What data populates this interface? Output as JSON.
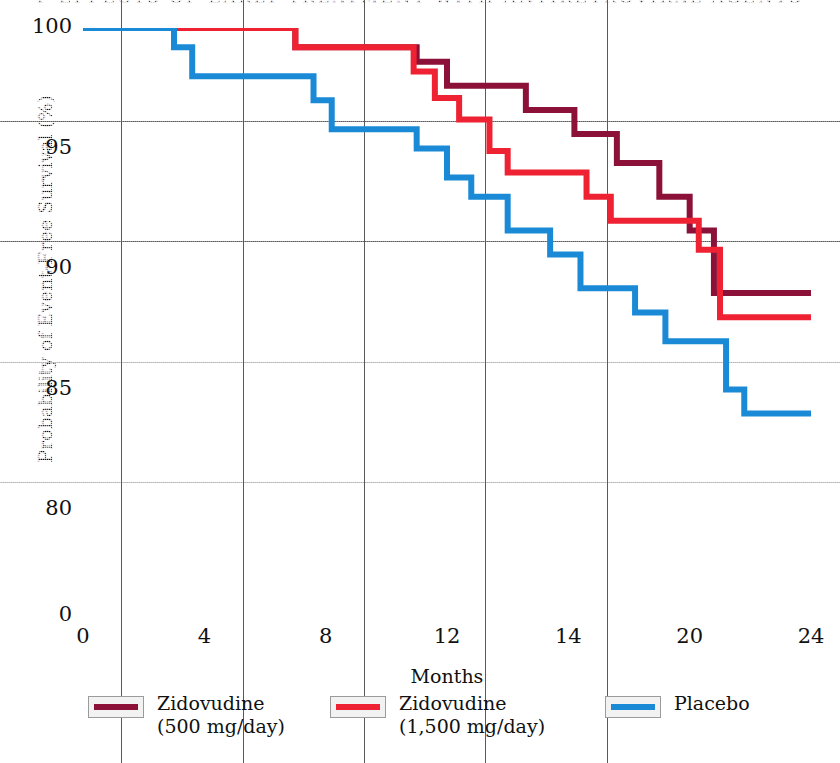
{
  "figure": {
    "title": "P EFFECTS OF EARLY TREATMENT WITH ANTIRETROVIRAL AGENTS",
    "background_color": "#e9e9e9",
    "frame_color": "#4a4a4a"
  },
  "axes": {
    "ylabel": "Probability of Event-Free Survival (%)",
    "xlabel": "Months",
    "yticks": [
      "100",
      "95",
      "90",
      "85",
      "80"
    ],
    "ybreak_tick": "0",
    "xticks": [
      "0",
      "4",
      "8",
      "12",
      "14",
      "20",
      "24"
    ],
    "ylim": [
      78,
      100
    ],
    "xlim": [
      0,
      24
    ],
    "grid": "on"
  },
  "legend": {
    "position": "below-axis",
    "items": [
      {
        "label_line1": "Zidovudine",
        "label_line2": "(500 mg/day)",
        "color": "#8c1138"
      },
      {
        "label_line1": "Zidovudine",
        "label_line2": "(1,500 mg/day)",
        "color": "#ee2233"
      },
      {
        "label_line1": "Placebo",
        "label_line2": "",
        "color": "#1b8ad6"
      }
    ]
  },
  "chart_data": {
    "type": "line",
    "subtype": "kaplan-meier-step",
    "title": "P EFFECTS OF EARLY TREATMENT WITH ANTIRETROVIRAL AGENTS",
    "xlabel": "Months",
    "ylabel": "Probability of Event-Free Survival (%)",
    "xlim": [
      0,
      24
    ],
    "ylim": [
      78,
      100
    ],
    "yticks": [
      100,
      95,
      90,
      85,
      80
    ],
    "xticks": [
      0,
      4,
      8,
      12,
      14,
      20,
      24
    ],
    "grid": true,
    "axis_break": "y-axis broken between 78 and 0",
    "series": [
      {
        "name": "Zidovudine (500 mg/day)",
        "color": "#8c1138",
        "steps": [
          [
            0,
            100.0
          ],
          [
            7.0,
            100.0
          ],
          [
            7.0,
            99.2
          ],
          [
            11.0,
            99.2
          ],
          [
            11.0,
            98.6
          ],
          [
            12.0,
            98.6
          ],
          [
            12.0,
            97.6
          ],
          [
            14.6,
            97.6
          ],
          [
            14.6,
            96.6
          ],
          [
            16.2,
            96.6
          ],
          [
            16.2,
            95.6
          ],
          [
            17.6,
            95.6
          ],
          [
            17.6,
            94.4
          ],
          [
            19.0,
            94.4
          ],
          [
            19.0,
            93.0
          ],
          [
            20.0,
            93.0
          ],
          [
            20.0,
            91.6
          ],
          [
            20.8,
            91.6
          ],
          [
            20.8,
            89.0
          ],
          [
            24.0,
            89.0
          ]
        ],
        "final_value": 89.0
      },
      {
        "name": "Zidovudine (1,500 mg/day)",
        "color": "#ee2233",
        "steps": [
          [
            0,
            100.0
          ],
          [
            7.0,
            100.0
          ],
          [
            7.0,
            99.2
          ],
          [
            10.9,
            99.2
          ],
          [
            10.9,
            98.2
          ],
          [
            11.6,
            98.2
          ],
          [
            11.6,
            97.1
          ],
          [
            12.4,
            97.1
          ],
          [
            12.4,
            96.2
          ],
          [
            13.4,
            96.2
          ],
          [
            13.4,
            94.9
          ],
          [
            14.0,
            94.9
          ],
          [
            14.0,
            94.0
          ],
          [
            16.6,
            94.0
          ],
          [
            16.6,
            93.0
          ],
          [
            17.4,
            93.0
          ],
          [
            17.4,
            92.0
          ],
          [
            20.3,
            92.0
          ],
          [
            20.3,
            90.8
          ],
          [
            21.0,
            90.8
          ],
          [
            21.0,
            88.0
          ],
          [
            24.0,
            88.0
          ]
        ],
        "final_value": 88.0
      },
      {
        "name": "Placebo",
        "color": "#1b8ad6",
        "steps": [
          [
            0,
            100.0
          ],
          [
            3.0,
            100.0
          ],
          [
            3.0,
            99.2
          ],
          [
            3.6,
            99.2
          ],
          [
            3.6,
            98.0
          ],
          [
            7.6,
            98.0
          ],
          [
            7.6,
            97.0
          ],
          [
            8.2,
            97.0
          ],
          [
            8.2,
            95.8
          ],
          [
            11.0,
            95.8
          ],
          [
            11.0,
            95.0
          ],
          [
            12.0,
            95.0
          ],
          [
            12.0,
            93.8
          ],
          [
            12.8,
            93.8
          ],
          [
            12.8,
            93.0
          ],
          [
            14.0,
            93.0
          ],
          [
            14.0,
            91.6
          ],
          [
            15.4,
            91.6
          ],
          [
            15.4,
            90.6
          ],
          [
            16.4,
            90.6
          ],
          [
            16.4,
            89.2
          ],
          [
            18.2,
            89.2
          ],
          [
            18.2,
            88.2
          ],
          [
            19.2,
            88.2
          ],
          [
            19.2,
            87.0
          ],
          [
            21.2,
            87.0
          ],
          [
            21.2,
            85.0
          ],
          [
            21.8,
            85.0
          ],
          [
            21.8,
            84.0
          ],
          [
            24.0,
            84.0
          ]
        ],
        "final_value": 84.0
      }
    ]
  }
}
